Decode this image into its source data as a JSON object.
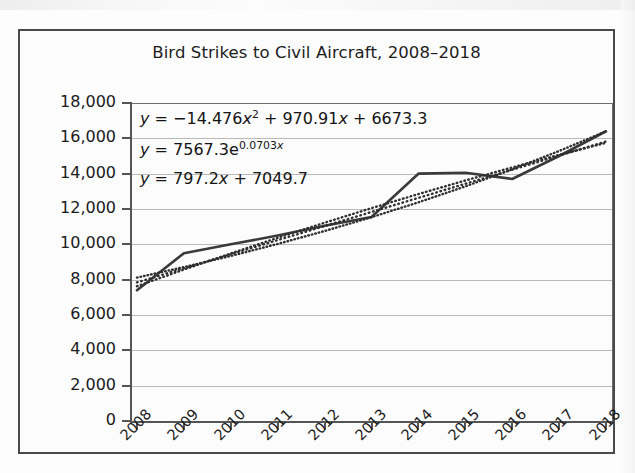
{
  "figure": {
    "title": "Bird Strikes to Civil Aircraft, 2008–2018"
  },
  "equations": [
    {
      "id": "quadratic-equation",
      "prefix": "y",
      "eq": " = −14.476x",
      "exp": "2",
      "rest": " + 970.91x + 6673.3"
    },
    {
      "id": "exponential-equation",
      "prefix": "y",
      "eq": " = 7567.3e",
      "exp": "0.0703x",
      "rest": ""
    },
    {
      "id": "linear-equation",
      "prefix": "y",
      "eq": " = 797.2x + 7049.7",
      "exp": "",
      "rest": ""
    }
  ],
  "axes": {
    "y_tick_labels": [
      "18,000",
      "16,000",
      "14,000",
      "12,000",
      "10,000",
      "8,000",
      "6,000",
      "4,000",
      "2,000",
      "0"
    ],
    "x_tick_labels": [
      "2008",
      "2009",
      "2010",
      "2011",
      "2012",
      "2013",
      "2014",
      "2015",
      "2016",
      "2017",
      "2018"
    ]
  },
  "colors": {
    "series_line": "#3a3a3a",
    "trend_line": "#2f2f2f",
    "gridline": "#b9b9b9",
    "axis": "#555555",
    "frame": "#4a4a4a",
    "text": "#1b1b1b",
    "background": "#fcfcfc"
  },
  "chart_data": {
    "type": "line",
    "title": "Bird Strikes to Civil Aircraft, 2008–2018",
    "xlabel": "",
    "ylabel": "",
    "ylim": [
      0,
      18000
    ],
    "ytick_step": 2000,
    "grid": true,
    "legend": "none",
    "x": [
      2008,
      2009,
      2010,
      2011,
      2012,
      2013,
      2014,
      2015,
      2016,
      2017,
      2018
    ],
    "categories": [
      "2008",
      "2009",
      "2010",
      "2011",
      "2012",
      "2013",
      "2014",
      "2015",
      "2016",
      "2017",
      "2018"
    ],
    "series": [
      {
        "name": "Bird strikes (reported)",
        "style": "solid",
        "values": [
          7400,
          9500,
          10000,
          10500,
          11050,
          11550,
          14000,
          14050,
          13700,
          15000,
          16400
        ]
      },
      {
        "name": "Quadratic trendline",
        "style": "dotted",
        "equation": "y = -14.476x^2 + 970.91x + 6673.3",
        "values": [
          7630,
          8571,
          9484,
          10368,
          11223,
          12049,
          12846,
          13615,
          14354,
          15065,
          15747
        ]
      },
      {
        "name": "Exponential trendline",
        "style": "dotted",
        "equation": "y = 7567.3e^(0.0703x)",
        "values": [
          8118,
          8710,
          9344,
          10024,
          10754,
          11537,
          12377,
          13278,
          14245,
          15283,
          16396
        ]
      },
      {
        "name": "Linear trendline",
        "style": "dotted",
        "equation": "y = 797.2x + 7049.7",
        "values": [
          7847,
          8644,
          9441,
          10238,
          11036,
          11833,
          12630,
          13427,
          14224,
          15022,
          15819
        ]
      }
    ]
  }
}
